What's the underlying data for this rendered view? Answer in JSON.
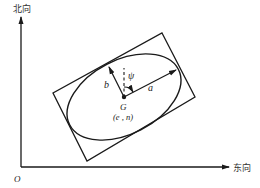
{
  "axes": {
    "north_label": "北向",
    "east_label": "东向",
    "origin_label": "O"
  },
  "ellipse": {
    "semi_major_label": "a",
    "semi_minor_label": "b",
    "angle_label": "ψ",
    "center_label": "G",
    "center_coords_label": "(e , n)"
  },
  "colors": {
    "stroke": "#1a1a1a",
    "background": "#ffffff"
  }
}
